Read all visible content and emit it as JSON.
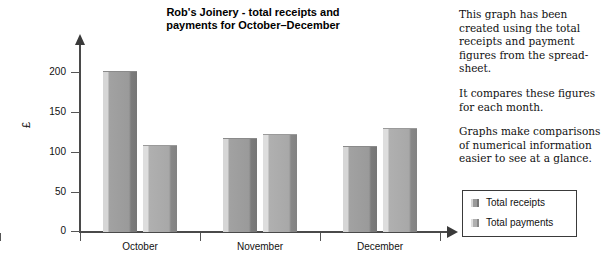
{
  "chart_data": {
    "type": "bar",
    "title": "Rob's Joinery - total receipts and payments for October–December",
    "title_line1": "Rob's Joinery - total receipts and",
    "title_line2": "payments for October–December",
    "categories": [
      "October",
      "November",
      "December"
    ],
    "series": [
      {
        "name": "Total receipts",
        "values": [
          201,
          117,
          108
        ],
        "color": "#9a9a9a"
      },
      {
        "name": "Total payments",
        "values": [
          109,
          123,
          130
        ],
        "color": "#b0b0b0"
      }
    ],
    "xlabel": "",
    "ylabel": "£",
    "ylim": [
      0,
      220
    ],
    "yticks": [
      0,
      50,
      100,
      150,
      200
    ],
    "ytick_labels": [
      "0",
      "50",
      "100",
      "150",
      "200"
    ],
    "grid": false,
    "legend_position": "right-bottom"
  },
  "side_notes": [
    "This graph has been created using the total receipts and payment figures from the spread-sheet.",
    "It compares these figures for each month.",
    "Graphs make comparisons of numerical information easier to see at a glance."
  ],
  "legend": {
    "items": [
      {
        "label": "Total receipts",
        "swatch": "receipts-swatch"
      },
      {
        "label": "Total payments",
        "swatch": "payments-swatch"
      }
    ]
  }
}
